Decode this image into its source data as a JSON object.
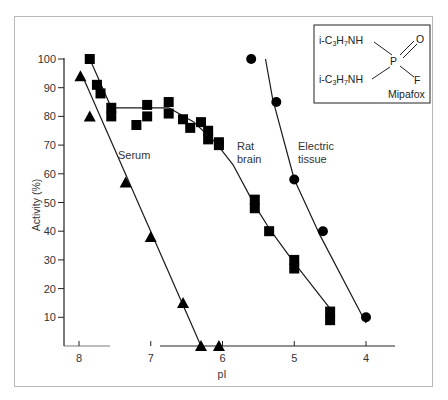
{
  "chart_data": {
    "type": "scatter",
    "title": "",
    "xlabel": "pI",
    "ylabel": "Activity (%)",
    "xlim": [
      8.2,
      3.6
    ],
    "ylim": [
      0,
      100
    ],
    "x_reversed": true,
    "x_ticks": [
      "8",
      "7",
      "6",
      "5",
      "4"
    ],
    "y_ticks": [
      "100",
      "90",
      "80",
      "70",
      "60",
      "50",
      "40",
      "30",
      "20",
      "10"
    ],
    "grid": false,
    "legend": "none (inline labels)",
    "series": [
      {
        "name": "Serum",
        "marker": "triangle",
        "x": [
          7.98,
          7.85,
          7.35,
          7.0,
          6.55,
          6.3,
          6.05
        ],
        "y": [
          94,
          80,
          57,
          38,
          15,
          0,
          0
        ],
        "fit_line": [
          [
            7.95,
            94
          ],
          [
            6.3,
            0
          ]
        ]
      },
      {
        "name": "Rat brain",
        "marker": "square",
        "x": [
          7.85,
          7.75,
          7.7,
          7.55,
          7.55,
          7.2,
          7.05,
          7.05,
          6.75,
          6.75,
          6.55,
          6.45,
          6.3,
          6.2,
          6.2,
          6.05,
          6.05,
          5.55,
          5.55,
          5.35,
          5.0,
          5.0,
          4.5,
          4.5
        ],
        "y": [
          100,
          91,
          88,
          83,
          80,
          77,
          84,
          80,
          85,
          81,
          79,
          76,
          78,
          75,
          72,
          70,
          71,
          51,
          48,
          40,
          30,
          27,
          12,
          9
        ],
        "fit_line": [
          [
            7.85,
            100
          ],
          [
            7.55,
            83
          ],
          [
            6.75,
            83
          ],
          [
            6.4,
            78
          ],
          [
            6.1,
            71
          ],
          [
            5.85,
            63
          ],
          [
            5.55,
            49
          ],
          [
            5.35,
            41
          ],
          [
            5.0,
            29
          ],
          [
            4.5,
            13
          ]
        ]
      },
      {
        "name": "Electric tissue",
        "marker": "circle",
        "x": [
          5.6,
          5.25,
          5.0,
          4.6,
          4.0
        ],
        "y": [
          100,
          85,
          58,
          40,
          10
        ],
        "fit_line": [
          [
            5.4,
            100
          ],
          [
            5.3,
            86
          ],
          [
            5.0,
            58
          ],
          [
            4.65,
            39
          ],
          [
            4.0,
            8
          ]
        ]
      }
    ],
    "annotations": [
      {
        "text": "Serum",
        "near": "serum line"
      },
      {
        "text": "Rat brain",
        "near": "rat brain curve"
      },
      {
        "text": "Electric tissue",
        "near": "electric tissue curve"
      }
    ],
    "inset": {
      "title": "Mipafox",
      "structure": {
        "group_top": "i-C3H7NH",
        "group_bottom": "i-C3H7NH",
        "center": "P",
        "double_bond": "O",
        "single_bond": "F"
      }
    }
  },
  "labels": {
    "ylabel": "Activity (%)",
    "xlabel": "pI",
    "serum": "Serum",
    "rat_brain_1": "Rat",
    "rat_brain_2": "brain",
    "electric_1": "Electric",
    "electric_2": "tissue",
    "mipafox": "Mipafox",
    "chem_prefix": "i-C",
    "chem_sub3": "3",
    "chem_h": "H",
    "chem_sub7": "7",
    "chem_nh": "NH",
    "chem_p": "P",
    "chem_o": "O",
    "chem_f": "F"
  }
}
